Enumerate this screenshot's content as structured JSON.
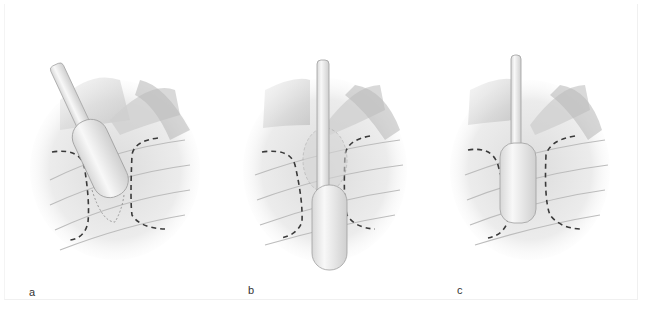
{
  "figure": {
    "panels": [
      {
        "id": "a",
        "label": "a",
        "description": "Instrument angled into tissue, tip within dashed outline"
      },
      {
        "id": "b",
        "label": "b",
        "description": "Instrument inserted vertically, extended below dashed outline"
      },
      {
        "id": "c",
        "label": "c",
        "description": "Instrument seated vertically within dashed outline"
      }
    ],
    "colors": {
      "background": "#ffffff",
      "tissue_light": "#f2f2f2",
      "tissue_shade": "#c8c8c8",
      "dashed_outline": "#3a3a3a",
      "instrument": "#ececec"
    }
  }
}
